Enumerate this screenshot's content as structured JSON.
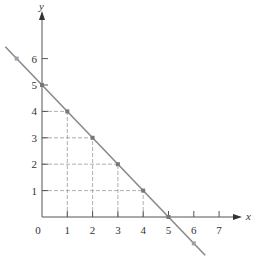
{
  "chart_data": {
    "type": "line",
    "title": "",
    "xlabel": "x",
    "ylabel": "y",
    "xlim": [
      0,
      7.8
    ],
    "ylim": [
      0,
      7.2
    ],
    "x_ticks": [
      0,
      1,
      2,
      3,
      4,
      5,
      6,
      7
    ],
    "y_ticks": [
      1,
      2,
      3,
      4,
      5,
      6
    ],
    "origin_label": "0",
    "grid": false,
    "series": [
      {
        "name": "line x + y = 5",
        "equation": "y = 5 - x",
        "color": "#8a8a8a",
        "x": [
          -1,
          0,
          1,
          2,
          3,
          4,
          5,
          6
        ],
        "y": [
          6,
          5,
          4,
          3,
          2,
          1,
          0,
          -1
        ]
      }
    ],
    "marked_points": [
      {
        "x": -1,
        "y": 6
      },
      {
        "x": 0,
        "y": 5
      },
      {
        "x": 1,
        "y": 4
      },
      {
        "x": 2,
        "y": 3
      },
      {
        "x": 3,
        "y": 2
      },
      {
        "x": 4,
        "y": 1
      },
      {
        "x": 5,
        "y": 0
      },
      {
        "x": 6,
        "y": -1
      }
    ],
    "dashed_guides": [
      {
        "x": 1,
        "y": 4
      },
      {
        "x": 2,
        "y": 3
      },
      {
        "x": 3,
        "y": 2
      },
      {
        "x": 4,
        "y": 1
      }
    ],
    "colors": {
      "axis": "#555555",
      "line": "#8a8a8a",
      "guides": "#9a9a9a",
      "points": "#777777"
    }
  }
}
